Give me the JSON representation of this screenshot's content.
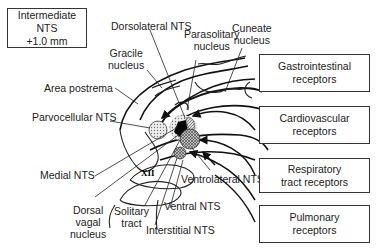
{
  "section_box": {
    "line1": "Intermediate NTS",
    "line2": "+1.0 mm"
  },
  "labels": {
    "dorsolateral": "Dorsolateral NTS",
    "parasolitary_1": "Parasolitary",
    "parasolitary_2": "nucleus",
    "cuneate_1": "Cuneate",
    "cuneate_2": "nucleus",
    "gracile_1": "Gracile",
    "gracile_2": "nucleus",
    "area_postrema": "Area postrema",
    "parvocellular": "Parvocellular NTS",
    "medial": "Medial NTS",
    "xii": "XII",
    "dorsal_vagal_1": "Dorsal",
    "dorsal_vagal_2": "vagal",
    "dorsal_vagal_3": "nucleus",
    "solitary_1": "Solitary",
    "solitary_2": "tract",
    "interstitial": "Interstitial NTS",
    "ventral": "Ventral NTS",
    "ventrolateral": "Ventrolateral NTS"
  },
  "receptor_boxes": [
    {
      "line1": "Gastrointestinal",
      "line2": "receptors"
    },
    {
      "line1": "Cardiovascular",
      "line2": "receptors"
    },
    {
      "line1": "Respiratory",
      "line2": "tract receptors"
    },
    {
      "line1": "Pulmonary",
      "line2": "receptors"
    }
  ]
}
